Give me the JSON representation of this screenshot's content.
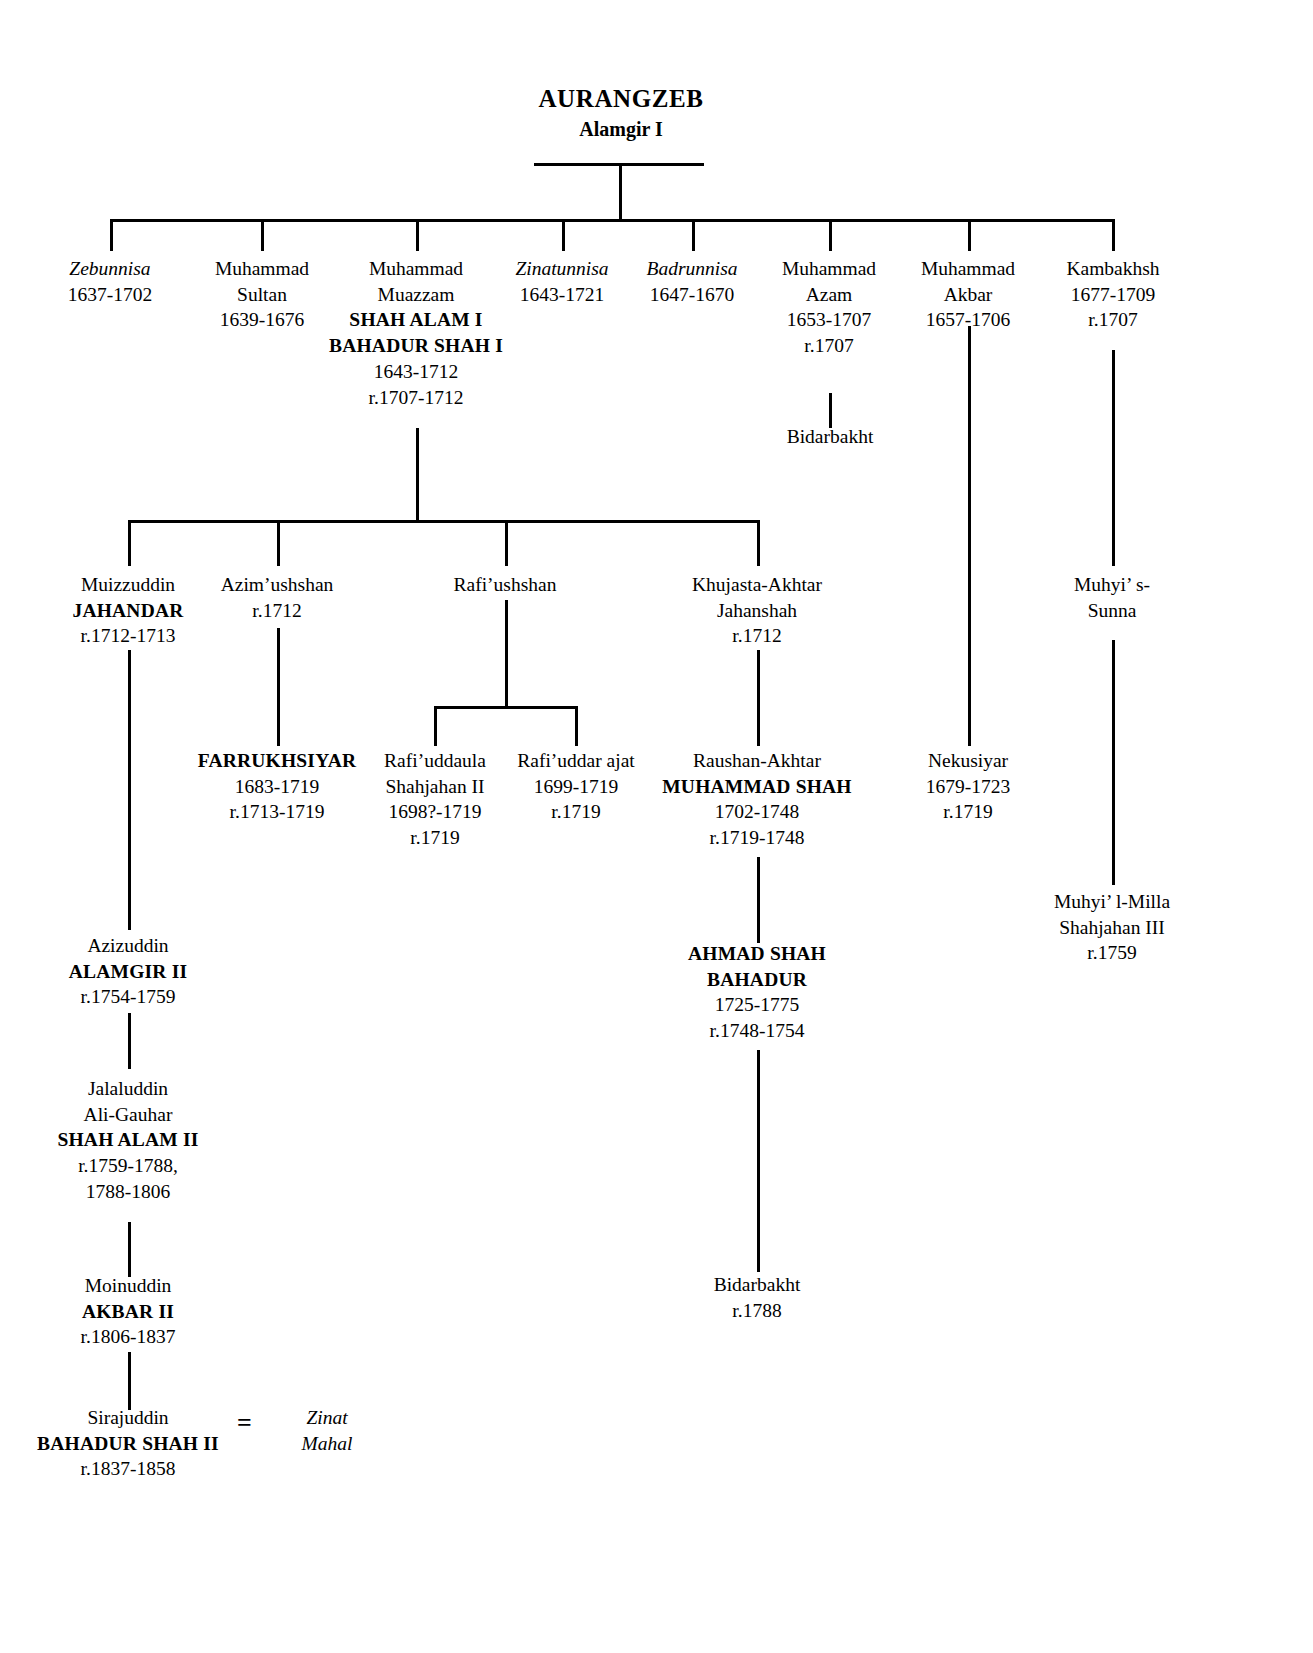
{
  "chart": {
    "type": "genealogy-tree",
    "root": {
      "name": "AURANGZEB",
      "subtitle": "Alamgir I"
    },
    "marriage_symbol": "=",
    "generation_2": [
      {
        "id": "zebunnisa",
        "lines": [
          {
            "text": "Zebunnisa",
            "style": "italic"
          },
          {
            "text": "1637-1702",
            "style": "normal"
          }
        ]
      },
      {
        "id": "muhammad-sultan",
        "lines": [
          {
            "text": "Muhammad",
            "style": "normal"
          },
          {
            "text": "Sultan",
            "style": "normal"
          },
          {
            "text": "1639-1676",
            "style": "normal"
          }
        ]
      },
      {
        "id": "muhammad-muazzam",
        "lines": [
          {
            "text": "Muhammad",
            "style": "normal"
          },
          {
            "text": "Muazzam",
            "style": "normal"
          },
          {
            "text": "SHAH ALAM I",
            "style": "bold"
          },
          {
            "text": "BAHADUR SHAH I",
            "style": "bold"
          },
          {
            "text": "1643-1712",
            "style": "normal"
          },
          {
            "text": "r.1707-1712",
            "style": "normal"
          }
        ]
      },
      {
        "id": "zinatunnisa",
        "lines": [
          {
            "text": "Zinatunnisa",
            "style": "italic"
          },
          {
            "text": "1643-1721",
            "style": "normal"
          }
        ]
      },
      {
        "id": "badrunnisa",
        "lines": [
          {
            "text": "Badrunnisa",
            "style": "italic"
          },
          {
            "text": "1647-1670",
            "style": "normal"
          }
        ]
      },
      {
        "id": "muhammad-azam",
        "lines": [
          {
            "text": "Muhammad",
            "style": "normal"
          },
          {
            "text": "Azam",
            "style": "normal"
          },
          {
            "text": "1653-1707",
            "style": "normal"
          },
          {
            "text": "r.1707",
            "style": "normal"
          }
        ]
      },
      {
        "id": "muhammad-akbar",
        "lines": [
          {
            "text": "Muhammad",
            "style": "normal"
          },
          {
            "text": "Akbar",
            "style": "normal"
          },
          {
            "text": "1657-1706",
            "style": "normal"
          }
        ]
      },
      {
        "id": "kambakhsh",
        "lines": [
          {
            "text": "Kambakhsh",
            "style": "normal"
          },
          {
            "text": "1677-1709",
            "style": "normal"
          },
          {
            "text": "r.1707",
            "style": "normal"
          }
        ]
      }
    ],
    "generation_3": [
      {
        "id": "bidarbakht-azam",
        "lines": [
          {
            "text": "Bidarbakht",
            "style": "normal"
          }
        ]
      },
      {
        "id": "muizzuddin-jahandar",
        "lines": [
          {
            "text": "Muizzuddin",
            "style": "normal"
          },
          {
            "text": "JAHANDAR",
            "style": "bold"
          },
          {
            "text": "r.1712-1713",
            "style": "normal"
          }
        ]
      },
      {
        "id": "azim-ushshan",
        "lines": [
          {
            "text": "Azim’ushshan",
            "style": "normal"
          },
          {
            "text": "r.1712",
            "style": "normal"
          }
        ]
      },
      {
        "id": "rafi-ushshan",
        "lines": [
          {
            "text": "Rafi’ushshan",
            "style": "normal"
          }
        ]
      },
      {
        "id": "khujasta-akhtar-jahanshah",
        "lines": [
          {
            "text": "Khujasta-Akhtar",
            "style": "normal"
          },
          {
            "text": "Jahanshah",
            "style": "normal"
          },
          {
            "text": "r.1712",
            "style": "normal"
          }
        ]
      },
      {
        "id": "muhyi-s-sunna",
        "lines": [
          {
            "text": "Muhyi’ s-",
            "style": "normal"
          },
          {
            "text": "Sunna",
            "style": "normal"
          }
        ]
      }
    ],
    "generation_4": [
      {
        "id": "farrukhsiyar",
        "lines": [
          {
            "text": "FARRUKHSIYAR",
            "style": "bold"
          },
          {
            "text": "1683-1719",
            "style": "normal"
          },
          {
            "text": "r.1713-1719",
            "style": "normal"
          }
        ]
      },
      {
        "id": "rafi-uddaula-shahjahan-ii",
        "lines": [
          {
            "text": "Rafi’uddaula",
            "style": "normal"
          },
          {
            "text": "Shahjahan II",
            "style": "normal"
          },
          {
            "text": "1698?-1719",
            "style": "normal"
          },
          {
            "text": "r.1719",
            "style": "normal"
          }
        ]
      },
      {
        "id": "rafi-uddarajat",
        "lines": [
          {
            "text": "Rafi’uddar ajat",
            "style": "normal"
          },
          {
            "text": "1699-1719",
            "style": "normal"
          },
          {
            "text": "r.1719",
            "style": "normal"
          }
        ]
      },
      {
        "id": "raushan-akhtar-muhammad-shah",
        "lines": [
          {
            "text": "Raushan-Akhtar",
            "style": "normal"
          },
          {
            "text": "MUHAMMAD SHAH",
            "style": "bold"
          },
          {
            "text": "1702-1748",
            "style": "normal"
          },
          {
            "text": "r.1719-1748",
            "style": "normal"
          }
        ]
      },
      {
        "id": "nekusiyar",
        "lines": [
          {
            "text": "Nekusiyar",
            "style": "normal"
          },
          {
            "text": "1679-1723",
            "style": "normal"
          },
          {
            "text": "r.1719",
            "style": "normal"
          }
        ]
      },
      {
        "id": "muhyi-l-milla-shahjahan-iii",
        "lines": [
          {
            "text": "Muhyi’ l-Milla",
            "style": "normal"
          },
          {
            "text": "Shahjahan  III",
            "style": "normal"
          },
          {
            "text": "r.1759",
            "style": "normal"
          }
        ]
      }
    ],
    "generation_5": [
      {
        "id": "azizuddin-alamgir-ii",
        "lines": [
          {
            "text": "Azizuddin",
            "style": "normal"
          },
          {
            "text": "ALAMGIR II",
            "style": "bold"
          },
          {
            "text": "r.1754-1759",
            "style": "normal"
          }
        ]
      },
      {
        "id": "ahmad-shah-bahadur",
        "lines": [
          {
            "text": "AHMAD SHAH",
            "style": "bold"
          },
          {
            "text": "BAHADUR",
            "style": "bold"
          },
          {
            "text": "1725-1775",
            "style": "normal"
          },
          {
            "text": "r.1748-1754",
            "style": "normal"
          }
        ]
      }
    ],
    "generation_6": [
      {
        "id": "jalaluddin-shah-alam-ii",
        "lines": [
          {
            "text": "Jalaluddin",
            "style": "normal"
          },
          {
            "text": "Ali-Gauhar",
            "style": "normal"
          },
          {
            "text": "SHAH ALAM II",
            "style": "bold"
          },
          {
            "text": "r.1759-1788,",
            "style": "normal"
          },
          {
            "text": "1788-1806",
            "style": "normal"
          }
        ]
      },
      {
        "id": "bidarbakht-1788",
        "lines": [
          {
            "text": "Bidarbakht",
            "style": "normal"
          },
          {
            "text": "r.1788",
            "style": "normal"
          }
        ]
      }
    ],
    "generation_7": [
      {
        "id": "moinuddin-akbar-ii",
        "lines": [
          {
            "text": "Moinuddin",
            "style": "normal"
          },
          {
            "text": "AKBAR II",
            "style": "bold"
          },
          {
            "text": "r.1806-1837",
            "style": "normal"
          }
        ]
      }
    ],
    "generation_8": [
      {
        "id": "sirajuddin-bahadur-shah-ii",
        "lines": [
          {
            "text": "Sirajuddin",
            "style": "normal"
          },
          {
            "text": "BAHADUR SHAH II",
            "style": "bold"
          },
          {
            "text": "r.1837-1858",
            "style": "normal"
          }
        ]
      },
      {
        "id": "zinat-mahal",
        "lines": [
          {
            "text": "Zinat",
            "style": "italic"
          },
          {
            "text": "Mahal",
            "style": "italic"
          }
        ]
      }
    ]
  }
}
